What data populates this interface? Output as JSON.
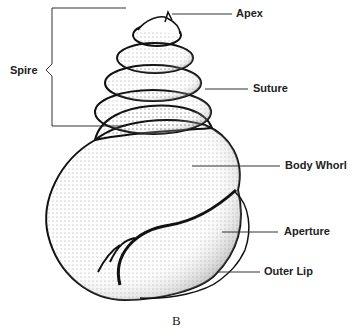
{
  "diagram": {
    "labels": {
      "spire": "Spire",
      "apex": "Apex",
      "suture": "Suture",
      "body_whorl": "Body Whorl",
      "aperture": "Aperture",
      "outer_lip": "Outer Lip"
    },
    "caption": "B",
    "colors": {
      "ink": "#1a1a1a",
      "background": "#ffffff"
    }
  }
}
